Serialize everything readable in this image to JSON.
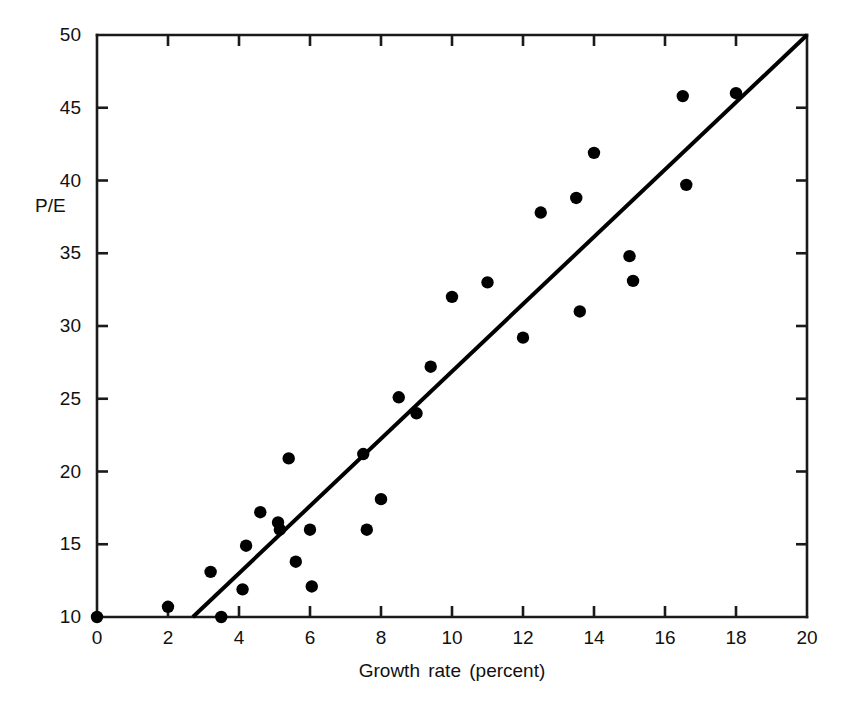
{
  "chart_data": {
    "type": "scatter",
    "title": "",
    "xlabel": "Growth rate (percent)",
    "ylabel": "P/E",
    "xlim": [
      0,
      20
    ],
    "ylim": [
      10,
      50
    ],
    "xticks": [
      0,
      2,
      4,
      6,
      8,
      10,
      12,
      14,
      16,
      18,
      20
    ],
    "yticks": [
      10,
      15,
      20,
      25,
      30,
      35,
      40,
      45,
      50
    ],
    "xtick_labels": [
      "0",
      "2",
      "4",
      "6",
      "8",
      "10",
      "12",
      "14",
      "16",
      "18",
      "20"
    ],
    "ytick_labels": [
      "10",
      "15",
      "20",
      "25",
      "30",
      "35",
      "40",
      "45",
      "50"
    ],
    "grid": false,
    "legend": null,
    "marker": "filled-circle",
    "marker_color": "#000000",
    "axis_color": "#1a1a1a",
    "background_color": "#ffffff",
    "points": [
      {
        "x": 0.0,
        "y": 10.0
      },
      {
        "x": 2.0,
        "y": 10.7
      },
      {
        "x": 3.2,
        "y": 13.1
      },
      {
        "x": 3.5,
        "y": 10.0
      },
      {
        "x": 4.1,
        "y": 11.9
      },
      {
        "x": 4.2,
        "y": 14.9
      },
      {
        "x": 4.6,
        "y": 17.2
      },
      {
        "x": 5.1,
        "y": 16.5
      },
      {
        "x": 5.15,
        "y": 16.0
      },
      {
        "x": 5.4,
        "y": 20.9
      },
      {
        "x": 5.6,
        "y": 13.8
      },
      {
        "x": 6.0,
        "y": 16.0
      },
      {
        "x": 6.05,
        "y": 12.1
      },
      {
        "x": 7.5,
        "y": 21.2
      },
      {
        "x": 7.6,
        "y": 16.0
      },
      {
        "x": 8.0,
        "y": 18.1
      },
      {
        "x": 8.5,
        "y": 25.1
      },
      {
        "x": 9.0,
        "y": 24.0
      },
      {
        "x": 9.4,
        "y": 27.2
      },
      {
        "x": 10.0,
        "y": 32.0
      },
      {
        "x": 11.0,
        "y": 33.0
      },
      {
        "x": 12.0,
        "y": 29.2
      },
      {
        "x": 12.5,
        "y": 37.8
      },
      {
        "x": 13.5,
        "y": 38.8
      },
      {
        "x": 13.6,
        "y": 31.0
      },
      {
        "x": 14.0,
        "y": 41.9
      },
      {
        "x": 15.0,
        "y": 34.8
      },
      {
        "x": 15.1,
        "y": 33.1
      },
      {
        "x": 16.5,
        "y": 45.8
      },
      {
        "x": 16.6,
        "y": 39.7
      },
      {
        "x": 18.0,
        "y": 46.0
      }
    ],
    "fit_line": {
      "name": "regression-line",
      "x_start": 2.7,
      "y_start": 10.0,
      "x_end": 20.0,
      "y_end": 50.0,
      "color": "#000000",
      "width": 4
    }
  }
}
